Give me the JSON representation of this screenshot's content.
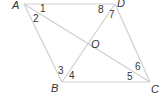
{
  "figure": {
    "type": "parallelogram-with-diagonals",
    "vertices": {
      "A": {
        "label": "A",
        "x": 24,
        "y": 4
      },
      "D": {
        "label": "D",
        "x": 115,
        "y": 4
      },
      "B": {
        "label": "B",
        "x": 62,
        "y": 82
      },
      "C": {
        "label": "C",
        "x": 150,
        "y": 82
      },
      "O": {
        "label": "O",
        "x": 95,
        "y": 43
      }
    },
    "vertex_labels": {
      "A": "A",
      "D": "D",
      "B": "B",
      "C": "C",
      "O": "O"
    },
    "angle_labels": {
      "a1": "1",
      "a2": "2",
      "a3": "3",
      "a4": "4",
      "a5": "5",
      "a6": "6",
      "a7": "7",
      "a8": "8"
    },
    "line_color": "#cfcfcf",
    "text_color": "#333333"
  }
}
